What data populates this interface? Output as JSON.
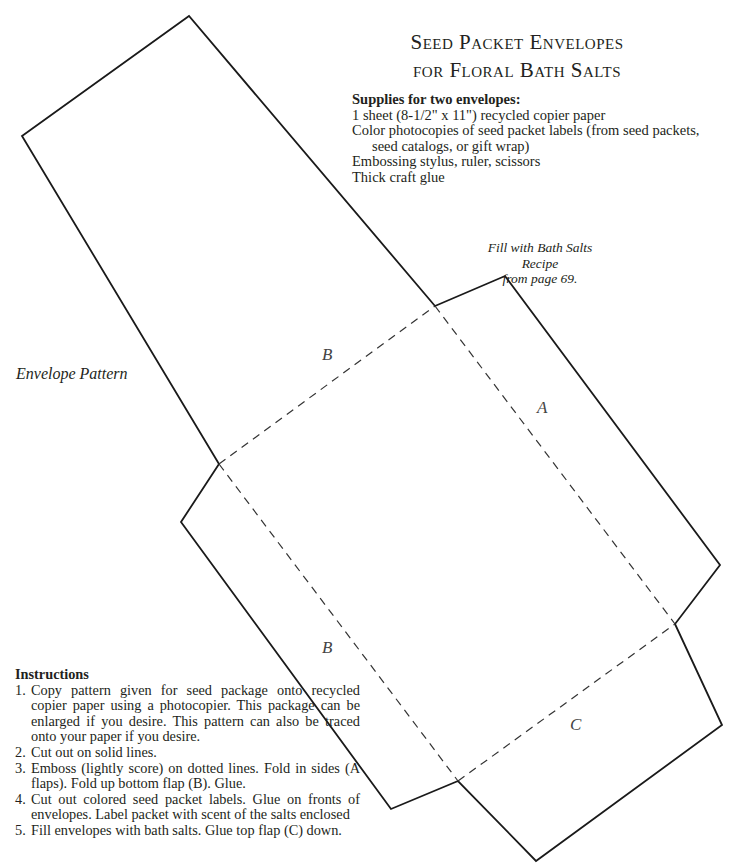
{
  "title": {
    "line1": "Seed Packet Envelopes",
    "line2": "for Floral Bath Salts"
  },
  "supplies": {
    "heading": "Supplies for two envelopes:",
    "items": [
      "1 sheet (8-1/2\" x 11\") recycled copier paper",
      "Color photocopies of seed packet labels (from seed packets,",
      "seed catalogs, or gift wrap)",
      "Embossing stylus, ruler, scissors",
      "Thick craft glue"
    ]
  },
  "note": {
    "line1": "Fill with Bath Salts Recipe",
    "line2": "from page 69."
  },
  "pattern": {
    "label": "Envelope Pattern",
    "flaps": {
      "b_top": "B",
      "a": "A",
      "b_bottom": "B",
      "c": "C"
    }
  },
  "instructions": {
    "heading": "Instructions",
    "steps": [
      {
        "num": "1.",
        "text": "Copy pattern given for seed package onto recycled copier paper using a photocopier. This package can be enlarged if you desire. This pattern can also be traced onto your paper if you desire."
      },
      {
        "num": "2.",
        "text": "Cut out on solid lines."
      },
      {
        "num": "3.",
        "text": "Emboss (lightly score) on dotted lines. Fold in sides (A flaps). Fold up bottom flap (B). Glue."
      },
      {
        "num": "4.",
        "text": "Cut out colored seed packet labels. Glue on fronts of envelopes. Label packet with scent of the salts enclosed"
      },
      {
        "num": "5.",
        "text": "Fill envelopes with bath salts. Glue top flap (C) down."
      }
    ]
  }
}
